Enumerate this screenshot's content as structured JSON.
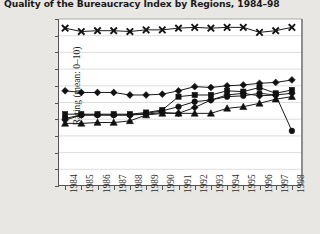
{
  "chart_data": {
    "type": "line",
    "title": "Quality of the Bureaucracy Index by Regions, 1984–98",
    "xlabel": "",
    "ylabel": "Rating (mean: 0–10)",
    "ylim": [
      0.0,
      10.0
    ],
    "ytick_labels": [
      "0.0",
      "1.0",
      "2.0",
      "3.0",
      "4.0",
      "5.0",
      "6.0",
      "7.0",
      "8.0",
      "9.0",
      "10.0"
    ],
    "ytick_values": [
      0.0,
      1.0,
      2.0,
      3.0,
      4.0,
      5.0,
      6.0,
      7.0,
      8.0,
      9.0,
      10.0
    ],
    "grid": true,
    "legend": "none",
    "categories": [
      "1984",
      "1985",
      "1986",
      "1987",
      "1988",
      "1989",
      "1990",
      "1991",
      "1992",
      "1993",
      "1994",
      "1995",
      "1996",
      "1997",
      "1998"
    ],
    "x": [
      1984,
      1985,
      1986,
      1987,
      1988,
      1989,
      1990,
      1991,
      1992,
      1993,
      1994,
      1995,
      1996,
      1997,
      1998
    ],
    "series": [
      {
        "name": "series-x-top",
        "marker": "x",
        "values": [
          9.45,
          9.25,
          9.3,
          9.3,
          9.25,
          9.35,
          9.35,
          9.45,
          9.5,
          9.45,
          9.5,
          9.5,
          9.2,
          9.3,
          9.5
        ]
      },
      {
        "name": "series-diamond",
        "marker": "diamond",
        "values": [
          5.7,
          5.6,
          5.6,
          5.6,
          5.45,
          5.45,
          5.5,
          5.7,
          5.95,
          5.9,
          6.0,
          6.05,
          6.15,
          6.2,
          6.35
        ]
      },
      {
        "name": "series-square",
        "marker": "square",
        "values": [
          4.3,
          4.3,
          4.3,
          4.3,
          4.3,
          4.4,
          4.55,
          5.35,
          5.45,
          5.45,
          5.7,
          5.65,
          5.9,
          5.55,
          5.75
        ]
      },
      {
        "name": "series-circle",
        "marker": "circle",
        "values": [
          4.05,
          4.25,
          4.25,
          4.25,
          4.25,
          4.35,
          4.5,
          4.75,
          5.05,
          5.15,
          5.35,
          5.4,
          5.55,
          5.45,
          3.3
        ]
      },
      {
        "name": "series-plus-diamond",
        "marker": "diamond",
        "values": [
          3.95,
          4.25,
          4.25,
          4.25,
          4.25,
          4.3,
          4.4,
          4.35,
          4.7,
          5.15,
          5.45,
          5.55,
          5.4,
          5.45,
          5.55
        ]
      },
      {
        "name": "series-triangle",
        "marker": "triangle",
        "values": [
          3.75,
          3.75,
          3.8,
          3.8,
          3.9,
          4.25,
          4.35,
          4.35,
          4.35,
          4.35,
          4.65,
          4.75,
          4.95,
          5.2,
          5.35
        ]
      }
    ]
  },
  "colors": {
    "background": "#e9e7e4",
    "plot_background": "#ffffff",
    "ink": "#111111",
    "grid": "#cfcfcf",
    "axis": "#555555"
  }
}
